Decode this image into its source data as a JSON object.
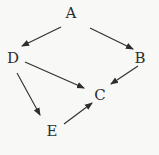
{
  "diagram": {
    "type": "directed-graph",
    "colors": {
      "background": "#f8f8f7",
      "ink": "#2e2e2e"
    },
    "nodes": [
      {
        "id": "A",
        "label": "A",
        "x": 71,
        "y": 13
      },
      {
        "id": "B",
        "label": "B",
        "x": 140,
        "y": 58
      },
      {
        "id": "C",
        "label": "C",
        "x": 100,
        "y": 95
      },
      {
        "id": "D",
        "label": "D",
        "x": 13,
        "y": 58
      },
      {
        "id": "E",
        "label": "E",
        "x": 52,
        "y": 131
      }
    ],
    "edges": [
      {
        "from": "A",
        "to": "D",
        "x1": 61,
        "y1": 27,
        "x2": 22,
        "y2": 46
      },
      {
        "from": "A",
        "to": "B",
        "x1": 90,
        "y1": 28,
        "x2": 133,
        "y2": 49
      },
      {
        "from": "D",
        "to": "C",
        "x1": 25,
        "y1": 62,
        "x2": 84,
        "y2": 88
      },
      {
        "from": "B",
        "to": "C",
        "x1": 138,
        "y1": 66,
        "x2": 111,
        "y2": 84
      },
      {
        "from": "D",
        "to": "E",
        "x1": 17,
        "y1": 73,
        "x2": 40,
        "y2": 115
      },
      {
        "from": "E",
        "to": "C",
        "x1": 64,
        "y1": 124,
        "x2": 92,
        "y2": 103
      }
    ]
  }
}
